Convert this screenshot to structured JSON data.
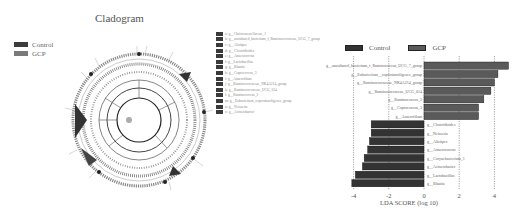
{
  "cladogram": {
    "title": "Cladogram",
    "legend": [
      {
        "label": "Control",
        "color": "#3c3c3c"
      },
      {
        "label": "GCP",
        "color": "#7a7a7a"
      }
    ],
    "key": [
      {
        "code": "a",
        "label": "g__Christensenellaceae_1"
      },
      {
        "code": "b",
        "label": "g__uncultured_bacterium_f_Ruminococcaceae_UCG_7_group"
      },
      {
        "code": "c",
        "label": "g__Alistipes"
      },
      {
        "code": "d",
        "label": "g__Clostridioides"
      },
      {
        "code": "e",
        "label": "g__Anaerococcus"
      },
      {
        "code": "f",
        "label": "g__Lactobacillus"
      },
      {
        "code": "g",
        "label": "g__Blautia"
      },
      {
        "code": "h",
        "label": "g__Coprococcus_3"
      },
      {
        "code": "i",
        "label": "g__Anaerofilum"
      },
      {
        "code": "j",
        "label": "g__Ruminococcaceae_NK4A214_group"
      },
      {
        "code": "k",
        "label": "g__Ruminococcaceae_UCG_014"
      },
      {
        "code": "l",
        "label": "g__Ruminococcus_2"
      },
      {
        "code": "m",
        "label": "g__Eubacterium_coprostanoligenes_group"
      },
      {
        "code": "n",
        "label": "g__Neisseria"
      },
      {
        "code": "o",
        "label": "g__Acinetobacter"
      }
    ]
  },
  "chart_data": {
    "type": "bar",
    "orientation": "horizontal",
    "title": "",
    "xlabel": "LDA SCORE (log 10)",
    "ylabel": "",
    "xlim": [
      -4.5,
      5
    ],
    "xticks": [
      -4,
      -2,
      0,
      2,
      4
    ],
    "grid": "vertical dashed at ticks",
    "legend": [
      "Control",
      "GCP"
    ],
    "legend_position": "top-left",
    "categories": [
      "g__uncultured_bacterium_f_Ruminococcus_UCG_7_group",
      "g__Eubacterium__coprostanoligenes_group",
      "g__Ruminococcaceae_NK4A214_group",
      "g__Ruminococcaceae_UCG_014",
      "g__Ruminococcus_2",
      "g__Coprococcus_3",
      "g__Anaerofilum",
      "g__Clostridioides",
      "g__Neisseria",
      "g__Alistipes",
      "g__Anaerococcus",
      "g__Corynebacterium_1",
      "g__Acinetobacter",
      "g__Lactobacillus",
      "g__Blautia"
    ],
    "series": [
      {
        "name": "GCP",
        "color": "#5a5a5a",
        "values": [
          4.8,
          4.2,
          4.0,
          3.8,
          3.4,
          3.1,
          3.1,
          null,
          null,
          null,
          null,
          null,
          null,
          null,
          null
        ]
      },
      {
        "name": "Control",
        "color": "#333333",
        "values": [
          null,
          null,
          null,
          null,
          null,
          null,
          null,
          -3.0,
          -3.0,
          -3.1,
          -3.2,
          -3.4,
          -3.5,
          -3.9,
          -4.1
        ]
      }
    ],
    "values": [
      4.8,
      4.2,
      4.0,
      3.8,
      3.4,
      3.1,
      3.1,
      -3.0,
      -3.0,
      -3.1,
      -3.2,
      -3.4,
      -3.5,
      -3.9,
      -4.1
    ]
  }
}
